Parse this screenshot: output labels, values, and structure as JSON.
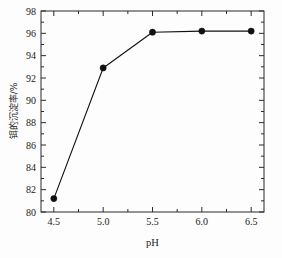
{
  "chart_data": {
    "type": "line",
    "title": "",
    "xlabel": "pH",
    "ylabel": "铒的沉淀率/%",
    "x": [
      4.5,
      5.0,
      5.5,
      6.0,
      6.5
    ],
    "values": [
      81.2,
      92.9,
      96.1,
      96.2,
      96.2
    ],
    "series": [
      {
        "name": "铒的沉淀率",
        "values": [
          81.2,
          92.9,
          96.1,
          96.2,
          96.2
        ]
      }
    ],
    "xlim": [
      4.37,
      6.63
    ],
    "ylim": [
      80,
      98
    ],
    "xticks": [
      "4.5",
      "5.0",
      "5.5",
      "6.0",
      "6.5"
    ],
    "xtick_values": [
      4.5,
      5.0,
      5.5,
      6.0,
      6.5
    ],
    "yticks": [
      "80",
      "82",
      "84",
      "86",
      "88",
      "90",
      "92",
      "94",
      "96",
      "98"
    ],
    "ytick_values": [
      80,
      82,
      84,
      86,
      88,
      90,
      92,
      94,
      96,
      98
    ],
    "x_minor_ticks": [
      4.75,
      5.25,
      5.75,
      6.25
    ],
    "y_minor_ticks": [
      81,
      83,
      85,
      87,
      89,
      91,
      93,
      95,
      97
    ],
    "grid": false,
    "legend": false,
    "legend_position": "none",
    "marker": "filled-circle",
    "line_color": "#111111",
    "marker_color": "#111111",
    "background_color": "#fdfdfd",
    "frame_color": "#2a2a2a"
  }
}
